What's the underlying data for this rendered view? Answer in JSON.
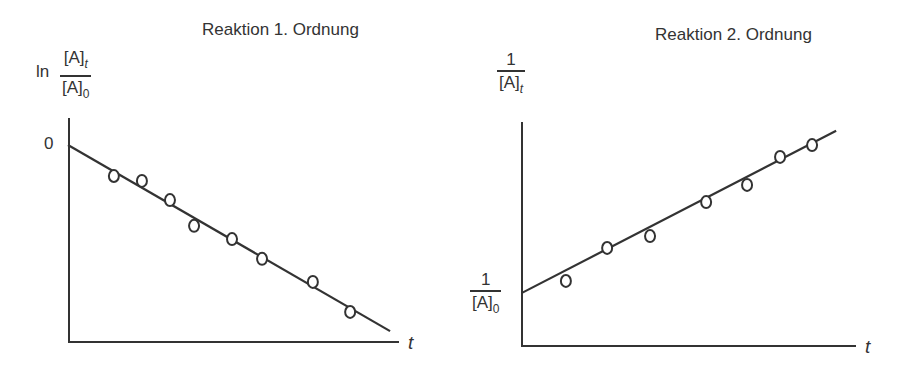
{
  "left": {
    "title": "Reaktion 1. Ordnung",
    "ylabel_prefix": "ln",
    "ylabel_num": "[A]",
    "ylabel_num_sub": "t",
    "ylabel_den": "[A]",
    "ylabel_den_sub": "0",
    "ytick": "0",
    "xlabel": "t"
  },
  "right": {
    "title": "Reaktion 2. Ordnung",
    "ylabel_num": "1",
    "ylabel_den": "[A]",
    "ylabel_den_sub": "t",
    "intercept_num": "1",
    "intercept_den": "[A]",
    "intercept_den_sub": "0",
    "xlabel": "t"
  },
  "chart_data": [
    {
      "type": "scatter",
      "title": "Reaktion 1. Ordnung",
      "xlabel": "t",
      "ylabel": "ln [A]t/[A]0",
      "yticks": [
        "0"
      ],
      "grid": false,
      "fit_line": {
        "x": [
          0,
          9.76
        ],
        "y": [
          0,
          -5.64
        ]
      },
      "x": [
        1.39,
        2.24,
        3.09,
        3.82,
        4.97,
        5.88,
        7.42,
        8.55
      ],
      "y": [
        -0.94,
        -1.09,
        -1.67,
        -2.45,
        -2.85,
        -3.45,
        -4.15,
        -5.06
      ],
      "note": "Linear decrease: ln([A]t/[A]0) = -k t; axis units arbitrary (pixels/33)"
    },
    {
      "type": "scatter",
      "title": "Reaktion 2. Ordnung",
      "xlabel": "t",
      "ylabel": "1/[A]t",
      "yticks": [
        "1/[A]0"
      ],
      "grid": false,
      "fit_line": {
        "x": [
          0,
          9.52
        ],
        "y": [
          1.61,
          6.52
        ]
      },
      "x": [
        1.33,
        2.58,
        3.88,
        5.58,
        6.82,
        7.82,
        8.79
      ],
      "y": [
        1.97,
        2.97,
        3.33,
        4.36,
        4.88,
        5.73,
        6.09
      ],
      "note": "Linear increase: 1/[A]t = 1/[A]0 + k t; axis units arbitrary (pixels/33, baseline at x-axis)"
    }
  ]
}
